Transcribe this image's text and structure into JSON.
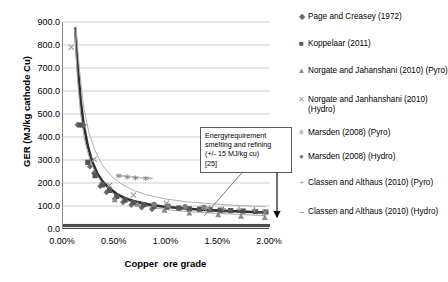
{
  "chart_data": {
    "type": "scatter",
    "title": "",
    "xlabel": "Copper  ore grade",
    "ylabel": "GER (MJ/kg cathode Cu)",
    "xlim": [
      0.0,
      2.0
    ],
    "ylim": [
      0.0,
      900.0
    ],
    "x_tick_labels": [
      "0.00%",
      "0.50%",
      "1.00%",
      "1.50%",
      "2.00%"
    ],
    "x_tick_values": [
      0.0,
      0.5,
      1.0,
      1.5,
      2.0
    ],
    "y_tick_labels": [
      "0.0",
      "100.0",
      "200.0",
      "300.0",
      "400.0",
      "500.0",
      "600.0",
      "700.0",
      "800.0",
      "900.0"
    ],
    "y_tick_values": [
      0,
      100,
      200,
      300,
      400,
      500,
      600,
      700,
      800,
      900
    ],
    "grid": "horizontal",
    "legend_position": "right",
    "series": [
      {
        "name": "Page and Creasey (1972)",
        "marker": "diamond",
        "color": "#6b6b6b",
        "points": [
          [
            0.14,
            453
          ],
          [
            0.2,
            452
          ],
          [
            0.26,
            272
          ],
          [
            0.3,
            243
          ],
          [
            0.36,
            186
          ],
          [
            0.42,
            160
          ],
          [
            0.5,
            131
          ],
          [
            0.58,
            116
          ],
          [
            0.66,
            104
          ],
          [
            0.76,
            93
          ],
          [
            0.86,
            86
          ]
        ]
      },
      {
        "name": "Koppelaar (2011)",
        "marker": "square",
        "color": "#555555",
        "points": [
          [
            0.17,
            452
          ],
          [
            0.24,
            290
          ],
          [
            0.31,
            232
          ],
          [
            0.38,
            192
          ],
          [
            0.45,
            168
          ],
          [
            0.52,
            142
          ],
          [
            0.6,
            126
          ],
          [
            0.68,
            115
          ],
          [
            0.78,
            106
          ],
          [
            0.88,
            99
          ],
          [
            1.0,
            95
          ],
          [
            1.12,
            91
          ],
          [
            1.22,
            88
          ],
          [
            1.32,
            86
          ],
          [
            1.42,
            84
          ],
          [
            1.52,
            82
          ],
          [
            1.62,
            80
          ],
          [
            1.74,
            78
          ],
          [
            1.86,
            76
          ],
          [
            1.96,
            74
          ]
        ]
      },
      {
        "name": "Norgate and Jahanshani (2010) (Pyro)",
        "marker": "triangle",
        "color": "#8c8c8c",
        "points": [
          [
            0.5,
            128
          ],
          [
            0.72,
            108
          ],
          [
            0.98,
            82
          ],
          [
            1.22,
            70
          ],
          [
            1.5,
            62
          ],
          [
            1.72,
            56
          ],
          [
            1.95,
            50
          ]
        ]
      },
      {
        "name": "Norgate and Janhanshani (2010) (Hydro)",
        "marker": "cross",
        "color": "#9a9a9a",
        "points": [
          [
            0.08,
            790
          ],
          [
            0.3,
            303
          ],
          [
            0.45,
            190
          ],
          [
            0.68,
            148
          ],
          [
            1.0,
            112
          ],
          [
            1.4,
            92
          ],
          [
            1.95,
            72
          ]
        ]
      },
      {
        "name": "Marsden (2008) (Pyro)",
        "marker": "asterisk",
        "color": "#8a8a8a",
        "points": [
          [
            0.54,
            231
          ],
          [
            0.62,
            226
          ],
          [
            0.7,
            222
          ],
          [
            0.8,
            220
          ]
        ]
      },
      {
        "name": "Marsden (2008) (Hydro)",
        "marker": "circle",
        "color": "#7d7d7d",
        "points": [
          [
            0.88,
            107
          ],
          [
            1.02,
            101
          ],
          [
            1.18,
            97
          ],
          [
            1.36,
            94
          ]
        ]
      },
      {
        "name": "Classen and Althaus (2010) (Pyro)",
        "marker": "plus",
        "color": "#909090",
        "points": [
          [
            1.55,
            88
          ],
          [
            1.7,
            86
          ],
          [
            1.85,
            84
          ]
        ]
      },
      {
        "name": "Classen and Althaus (2010) (Hydro)",
        "marker": "dash",
        "color": "#4a4a4a",
        "points": [
          [
            1.55,
            76
          ],
          [
            1.72,
            74
          ],
          [
            1.9,
            72
          ]
        ]
      }
    ],
    "curves": [
      {
        "name": "main-trend-thick",
        "color": "#2f2f2f",
        "width": 2.6,
        "points": [
          [
            0.118,
            872
          ],
          [
            0.14,
            720
          ],
          [
            0.17,
            560
          ],
          [
            0.2,
            452
          ],
          [
            0.24,
            360
          ],
          [
            0.28,
            295
          ],
          [
            0.33,
            243
          ],
          [
            0.38,
            208
          ],
          [
            0.44,
            180
          ],
          [
            0.52,
            152
          ],
          [
            0.6,
            134
          ],
          [
            0.7,
            119
          ],
          [
            0.82,
            107
          ],
          [
            0.96,
            98
          ],
          [
            1.12,
            91
          ],
          [
            1.3,
            85
          ],
          [
            1.5,
            80
          ],
          [
            1.72,
            76
          ],
          [
            1.95,
            72
          ]
        ]
      },
      {
        "name": "upper-envelope",
        "color": "#b0b0b0",
        "width": 1.0,
        "points": [
          [
            0.125,
            880
          ],
          [
            0.16,
            690
          ],
          [
            0.2,
            530
          ],
          [
            0.25,
            420
          ],
          [
            0.31,
            340
          ],
          [
            0.38,
            278
          ],
          [
            0.46,
            233
          ],
          [
            0.56,
            197
          ],
          [
            0.68,
            168
          ],
          [
            0.82,
            147
          ],
          [
            1.0,
            130
          ],
          [
            1.2,
            118
          ],
          [
            1.42,
            110
          ],
          [
            1.66,
            103
          ],
          [
            1.95,
            97
          ]
        ]
      },
      {
        "name": "lower-envelope",
        "color": "#a8a8a8",
        "width": 1.0,
        "points": [
          [
            0.112,
            868
          ],
          [
            0.14,
            650
          ],
          [
            0.17,
            500
          ],
          [
            0.21,
            385
          ],
          [
            0.26,
            300
          ],
          [
            0.32,
            238
          ],
          [
            0.39,
            192
          ],
          [
            0.48,
            155
          ],
          [
            0.58,
            130
          ],
          [
            0.7,
            110
          ],
          [
            0.86,
            93
          ],
          [
            1.04,
            82
          ],
          [
            1.26,
            74
          ],
          [
            1.5,
            68
          ],
          [
            1.72,
            63
          ],
          [
            1.95,
            58
          ]
        ]
      },
      {
        "name": "marsden-pyro-band",
        "color": "#b4b4b4",
        "width": 1.6,
        "points": [
          [
            0.52,
            233
          ],
          [
            0.62,
            228
          ],
          [
            0.74,
            223
          ],
          [
            0.86,
            220
          ]
        ]
      }
    ],
    "bands": [
      {
        "name": "smelting-refining-energy-band",
        "color": "#4e4e4e",
        "y_center": 15,
        "y_tolerance": 7
      }
    ]
  },
  "callout": {
    "name": "energy-requirement-callout",
    "lines": [
      "Energyrequirement",
      "smelting and refining",
      "(+/- 15 MJ/kg cu)",
      "[25]"
    ]
  },
  "legend": {
    "items": [
      {
        "label": "Page and Creasey (1972)",
        "marker": "◆",
        "color": "#6b6b6b"
      },
      {
        "label": "Koppelaar (2011)",
        "marker": "■",
        "color": "#555555"
      },
      {
        "label": "Norgate and Jahanshani (2010) (Pyro)",
        "marker": "▲",
        "color": "#8c8c8c"
      },
      {
        "label": "Norgate and Janhanshani (2010) (Hydro)",
        "marker": "✕",
        "color": "#9a9a9a"
      },
      {
        "label": "Marsden (2008) (Pyro)",
        "marker": "✳",
        "color": "#8a8a8a"
      },
      {
        "label": "Marsden (2008) (Hydro)",
        "marker": "●",
        "color": "#7d7d7d"
      },
      {
        "label": "Classen and Althaus (2010) (Pyro)",
        "marker": "+",
        "color": "#909090"
      },
      {
        "label": "Classen and Althaus (2010) (Hydro)",
        "marker": "–",
        "color": "#4a4a4a"
      }
    ]
  }
}
